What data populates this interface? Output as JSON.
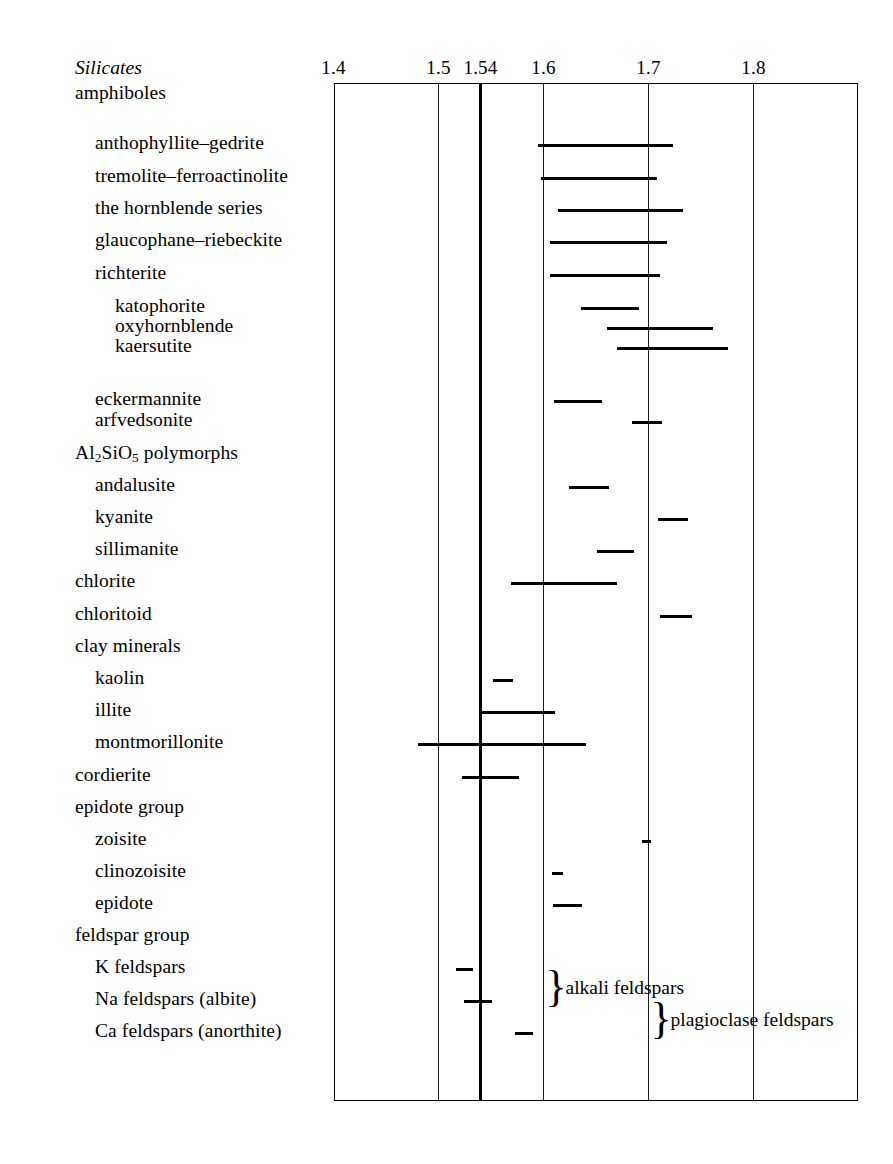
{
  "chart_data": {
    "type": "table",
    "title": "",
    "xlabel": "refractive index",
    "ylabel": "",
    "xlim": [
      1.4,
      1.85
    ],
    "grid": true,
    "legend": "none",
    "axis": {
      "ticks": [
        {
          "label": "1.4",
          "value": 1.4,
          "bold": false
        },
        {
          "label": "1.5",
          "value": 1.5,
          "bold": false
        },
        {
          "label": "1.54",
          "value": 1.54,
          "bold": true
        },
        {
          "label": "1.6",
          "value": 1.6,
          "bold": false
        },
        {
          "label": "1.7",
          "value": 1.7,
          "bold": false
        },
        {
          "label": "1.8",
          "value": 1.8,
          "bold": false
        }
      ]
    },
    "rows": [
      {
        "label": "Silicates",
        "style": "italic",
        "indent": 0,
        "y": 72,
        "bar": null
      },
      {
        "label": "amphiboles",
        "style": "plain",
        "indent": 0,
        "y": 97,
        "bar": null
      },
      {
        "label": "anthophyllite–gedrite",
        "style": "plain",
        "indent": 1,
        "y": 147,
        "bar": [
          1.595,
          1.723
        ]
      },
      {
        "label": "tremolite–ferroactinolite",
        "style": "plain",
        "indent": 1,
        "y": 180,
        "bar": [
          1.598,
          1.708
        ]
      },
      {
        "label": "the hornblende series",
        "style": "plain",
        "indent": 1,
        "y": 212,
        "bar": [
          1.614,
          1.733
        ]
      },
      {
        "label": "glaucophane–riebeckite",
        "style": "plain",
        "indent": 1,
        "y": 244,
        "bar": [
          1.606,
          1.718
        ]
      },
      {
        "label": "richterite",
        "style": "plain",
        "indent": 1,
        "y": 277,
        "bar": [
          1.606,
          1.711
        ]
      },
      {
        "label": "katophorite",
        "style": "plain",
        "indent": 2,
        "y": 310,
        "bar": [
          1.636,
          1.691
        ]
      },
      {
        "label": "oxyhornblende",
        "style": "plain",
        "indent": 2,
        "y": 330,
        "bar": [
          1.66,
          1.761
        ]
      },
      {
        "label": "kaersutite",
        "style": "plain",
        "indent": 2,
        "y": 350,
        "bar": [
          1.67,
          1.776
        ]
      },
      {
        "label": "eckermannite",
        "style": "plain",
        "indent": 1,
        "y": 403,
        "bar": [
          1.61,
          1.656
        ]
      },
      {
        "label": "arfvedsonite",
        "style": "plain",
        "indent": 1,
        "y": 424,
        "bar": [
          1.684,
          1.713
        ]
      },
      {
        "label": "Al2SiO5 polymorphs",
        "style": "formula",
        "indent": 0,
        "y": 457,
        "bar": null
      },
      {
        "label": "andalusite",
        "style": "plain",
        "indent": 1,
        "y": 489,
        "bar": [
          1.624,
          1.662
        ]
      },
      {
        "label": "kyanite",
        "style": "plain",
        "indent": 1,
        "y": 521,
        "bar": [
          1.709,
          1.738
        ]
      },
      {
        "label": "sillimanite",
        "style": "plain",
        "indent": 1,
        "y": 553,
        "bar": [
          1.651,
          1.686
        ]
      },
      {
        "label": "chlorite",
        "style": "plain",
        "indent": 0,
        "y": 585,
        "bar": [
          1.569,
          1.67
        ]
      },
      {
        "label": "chloritoid",
        "style": "plain",
        "indent": 0,
        "y": 618,
        "bar": [
          1.711,
          1.741
        ]
      },
      {
        "label": "clay minerals",
        "style": "plain",
        "indent": 0,
        "y": 650,
        "bar": null
      },
      {
        "label": "kaolin",
        "style": "plain",
        "indent": 1,
        "y": 682,
        "bar": [
          1.552,
          1.571
        ]
      },
      {
        "label": "illite",
        "style": "plain",
        "indent": 1,
        "y": 714,
        "bar": [
          1.54,
          1.611
        ]
      },
      {
        "label": "montmorillonite",
        "style": "plain",
        "indent": 1,
        "y": 746,
        "bar": [
          1.48,
          1.64
        ]
      },
      {
        "label": "cordierite",
        "style": "plain",
        "indent": 0,
        "y": 779,
        "bar": [
          1.522,
          1.577
        ]
      },
      {
        "label": "epidote group",
        "style": "plain",
        "indent": 0,
        "y": 811,
        "bar": null
      },
      {
        "label": "zoisite",
        "style": "plain",
        "indent": 1,
        "y": 843,
        "bar": [
          1.694,
          1.702
        ]
      },
      {
        "label": "clinozoisite",
        "style": "plain",
        "indent": 1,
        "y": 875,
        "bar": [
          1.608,
          1.619
        ]
      },
      {
        "label": "epidote",
        "style": "plain",
        "indent": 1,
        "y": 907,
        "bar": [
          1.609,
          1.637
        ]
      },
      {
        "label": "feldspar group",
        "style": "plain",
        "indent": 0,
        "y": 939,
        "bar": null
      },
      {
        "label": "K feldspars",
        "style": "plain",
        "indent": 1,
        "y": 971,
        "bar": [
          1.517,
          1.533
        ]
      },
      {
        "label": "Na feldspars (albite)",
        "style": "plain",
        "indent": 1,
        "y": 1003,
        "bar": [
          1.524,
          1.551
        ]
      },
      {
        "label": "Ca feldspars (anorthite)",
        "style": "plain",
        "indent": 1,
        "y": 1035,
        "bar": [
          1.573,
          1.59
        ]
      }
    ],
    "annotations": [
      {
        "name": "alkali-feldspars",
        "label": "alkali feldspars",
        "x": 1.6,
        "y_center": 987,
        "span": [
          971,
          1003
        ]
      },
      {
        "name": "plagioclase-feldspars",
        "label": "plagioclase feldspars",
        "x": 1.7,
        "y_center": 1019,
        "span": [
          1003,
          1035
        ]
      }
    ]
  },
  "formula": {
    "al2sio5": {
      "pre": "Al",
      "sub1": "2",
      "mid": "SiO",
      "sub2": "5",
      "post": " polymorphs"
    }
  }
}
